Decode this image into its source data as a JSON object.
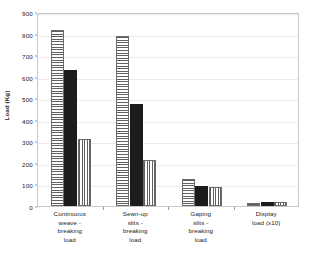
{
  "chart_data": {
    "type": "bar",
    "title": "",
    "xlabel": "",
    "ylabel": "Load (Kg)",
    "ylim": [
      0,
      900
    ],
    "y_ticks": [
      0,
      100,
      200,
      300,
      400,
      500,
      600,
      700,
      800,
      900
    ],
    "y_tick_labels": [
      "0",
      "100",
      "200",
      "300",
      "400",
      "500",
      "600",
      "700",
      "800",
      "900"
    ],
    "grid": true,
    "legend": "none",
    "categories": [
      "Continuous\nweave -\nbreaking\nload",
      "Sewn-up\nslits -\nbreaking\nload",
      "Gaping\nslits -\nbreaking\nload",
      "Display\nload  (x10)"
    ],
    "series": [
      {
        "name": "series-1",
        "pattern": "horizontal-stripes",
        "color": "#5f5f5f",
        "values": [
          815,
          790,
          125,
          14
        ]
      },
      {
        "name": "series-2",
        "pattern": "solid-black",
        "color": "#1c1c1c",
        "values": [
          630,
          475,
          95,
          18
        ]
      },
      {
        "name": "series-3",
        "pattern": "vertical-stripes",
        "color": "#5f5f5f",
        "values": [
          312,
          212,
          88,
          18
        ]
      }
    ]
  }
}
